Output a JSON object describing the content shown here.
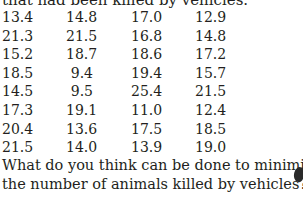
{
  "intro_text": "that had been killed by vehicles.",
  "table": {
    "rows": [
      [
        "13.4",
        "14.8",
        "17.0",
        "12.9"
      ],
      [
        "21.3",
        "21.5",
        "16.8",
        "14.8"
      ],
      [
        "15.2",
        "18.7",
        "18.6",
        "17.2"
      ],
      [
        "18.5",
        "9.4",
        "19.4",
        "15.7"
      ],
      [
        "14.5",
        "9.5",
        "25.4",
        "21.5"
      ],
      [
        "17.3",
        "19.1",
        "11.0",
        "12.4"
      ],
      [
        "20.4",
        "13.6",
        "17.5",
        "18.5"
      ],
      [
        "21.5",
        "14.0",
        "13.9",
        "19.0"
      ]
    ]
  },
  "question": {
    "line1": "What do you think can be done to minimize",
    "line2": "the number of animals killed by vehicles?"
  }
}
